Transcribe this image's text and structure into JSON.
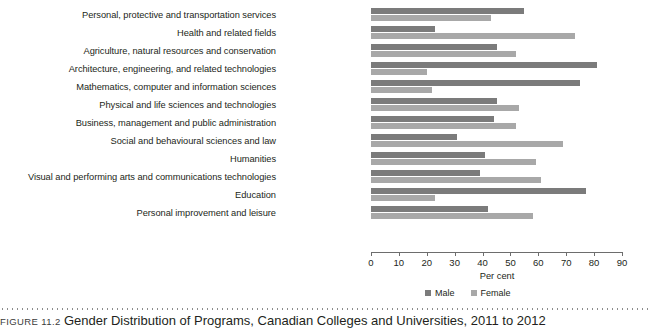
{
  "chart_data": {
    "type": "bar",
    "orientation": "horizontal",
    "title": "Gender Distribution of Programs, Canadian Colleges and Universities, 2011 to 2012",
    "xlabel": "Per cent",
    "ylabel": "",
    "xlim": [
      0,
      90
    ],
    "xticks": [
      0,
      10,
      20,
      30,
      40,
      50,
      60,
      70,
      80,
      90
    ],
    "grid": false,
    "legend_position": "bottom",
    "categories": [
      "Personal, protective and transportation services",
      "Health and related fields",
      "Agriculture, natural resources and conservation",
      "Architecture, engineering, and related technologies",
      "Mathematics, computer and information sciences",
      "Physical and life sciences and technologies",
      "Business, management and public administration",
      "Social and behavioural sciences and law",
      "Humanities",
      "Visual and performing arts and communications technologies",
      "Education",
      "Personal improvement and leisure"
    ],
    "series": [
      {
        "name": "Male",
        "color": "#7b7b7b",
        "values": [
          55,
          23,
          45,
          81,
          75,
          45,
          44,
          31,
          41,
          39,
          77,
          42
        ]
      },
      {
        "name": "Female",
        "color": "#a8a8a8",
        "values": [
          43,
          73,
          52,
          20,
          22,
          53,
          52,
          69,
          59,
          61,
          23,
          58
        ]
      }
    ]
  },
  "caption": {
    "number": "FIGURE 11.2",
    "title": "Gender Distribution of Programs, Canadian Colleges and Universities, 2011 to 2012"
  }
}
